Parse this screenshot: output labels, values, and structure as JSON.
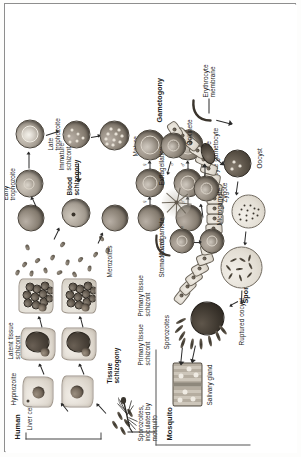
{
  "figure": {
    "orientation": "rotated-90-ccw",
    "hosts": {
      "human": "Human",
      "mosquito": "Mosquito"
    },
    "phase_headings": {
      "tissue_schizogony": "Tissue\nschizogony",
      "blood_schizogony": "Blood\nschizogony",
      "gametogony": "Gametogony",
      "sporogony": "Sporogony"
    },
    "labels": {
      "liver_cells": "Liver cells",
      "hypnozoite": "Hypnozoite",
      "latent_tissue_schizont": "Latent tissue\nschizont",
      "sporozoites_inoculated": "Sporozoites,\ninoculated by\nmosquito",
      "primary_tissue_schizont_1": "Primary tissue\nschizont",
      "primary_tissue_schizont_2": "Primary tissue\nschizont",
      "merozoites": "Merozoites",
      "early_trophozoite": "Early\ntrophozoite",
      "late_trophozoite": "Late\ntrophozoite",
      "immature_schizont": "Immature\nschizont",
      "mature_schizont": "Mature\nschizont",
      "immature_gametocyte": "Immature\ngametocyte",
      "mature_gametocyte": "Mature\ngametocyte",
      "erythrocyte_membrane": "Erythrocyte\nmembrane",
      "exflagellation": "Exflagellation",
      "macrogamete": "Macrogamete",
      "microgamete": "Microgamete",
      "zygote": "Zygote",
      "ookinete": "Ookinete",
      "oocyst": "Oocyst",
      "stomach_wall": "Stomach wall",
      "ruptured_oocyst": "Ruptured oocyst",
      "sporozoites": "Sporozoites",
      "salivary_gland": "Salivary gland"
    },
    "symbols": {
      "female": "♀",
      "male": "♂"
    },
    "colors": {
      "ink": "#1b1b1b",
      "line": "#2a2a2a",
      "frame": "#8e8e8e",
      "paper": "#ffffff",
      "cell_fill": "#e2dcd3",
      "parasite_dark": "#3a342c"
    }
  }
}
